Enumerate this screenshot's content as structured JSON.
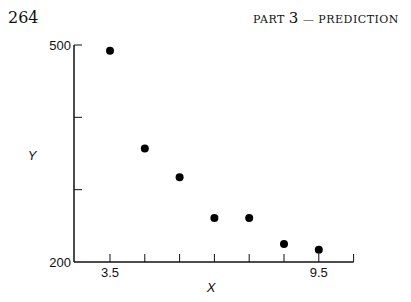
{
  "header": {
    "page_number": "264",
    "running_head_prefix": "PART",
    "running_head_num": "3",
    "running_head_suffix": "— PREDICTION"
  },
  "chart_data": {
    "type": "scatter",
    "title": "",
    "xlabel": "X",
    "ylabel": "Y",
    "xlim": [
      2.5,
      10.5
    ],
    "ylim": [
      200,
      500
    ],
    "x_tick_labels": [
      "3.5",
      "9.5"
    ],
    "y_tick_labels": [
      "500",
      "200"
    ],
    "x_ticks": [
      3.5,
      4.5,
      5.5,
      6.5,
      7.5,
      8.5,
      9.5,
      10.5
    ],
    "y_ticks": [
      200,
      300,
      400,
      500
    ],
    "grid": false,
    "x": [
      3.5,
      4.5,
      5.5,
      6.5,
      7.5,
      8.5,
      9.5
    ],
    "y": [
      492,
      357,
      317,
      261,
      261,
      225,
      217
    ]
  }
}
